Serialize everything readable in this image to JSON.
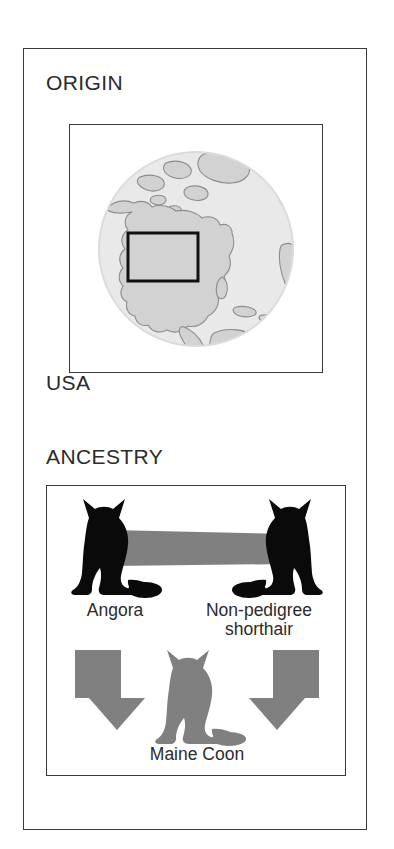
{
  "factbox": {
    "sections": [
      {
        "id": "origin",
        "heading": "ORIGIN",
        "caption": "USA",
        "figure": {
          "name": "world-globe-map",
          "description": "Grayscale globe centered on the Americas with a black rectangle highlighting the United States",
          "highlighted_region": "USA",
          "colors": {
            "ocean": "#e9e9e9",
            "land": "#d2d2d2",
            "coastline": "#8c8c8c",
            "highlight_outline": "#111111"
          }
        }
      },
      {
        "id": "ancestry",
        "heading": "ANCESTRY",
        "figure": {
          "name": "breed-ancestry-diagram",
          "parents": [
            {
              "label": "Angora",
              "silhouette": "cat-silhouette-black"
            },
            {
              "label": "Non-pedigree\nshorthair",
              "label_line1": "Non-pedigree",
              "label_line2": "shorthair",
              "silhouette": "cat-silhouette-black"
            }
          ],
          "connector": {
            "name": "pairing-bar",
            "color": "#808080"
          },
          "arrows": [
            {
              "name": "descent-arrow-left",
              "direction": "right-down",
              "color": "#808080"
            },
            {
              "name": "descent-arrow-right",
              "direction": "left-down",
              "color": "#808080"
            }
          ],
          "offspring": {
            "label": "Maine Coon",
            "silhouette": "cat-silhouette-gray",
            "color": "#808080"
          }
        }
      }
    ]
  },
  "colors": {
    "frame": "#3a3a3a",
    "text": "#2b2b2b",
    "silhouette_black": "#0a0a0a",
    "accent_gray": "#808080",
    "background": "#ffffff"
  }
}
